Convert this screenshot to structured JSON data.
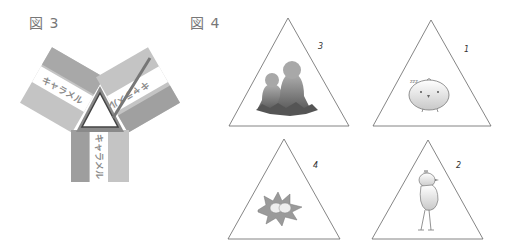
{
  "figures": {
    "fig3": {
      "label": "図 3",
      "strips": [
        {
          "position": "left",
          "text": "キャラメル"
        },
        {
          "position": "right",
          "text": "キャラメル"
        },
        {
          "position": "bottom",
          "text": "キャラメル"
        }
      ],
      "center": "white triangle"
    },
    "fig4": {
      "label": "図 4",
      "cards": [
        {
          "position": "top-left",
          "number": "3",
          "picture": "tulips-silhouette"
        },
        {
          "position": "top-right",
          "number": "1",
          "picture": "round-chick"
        },
        {
          "position": "bottom-left",
          "number": "4",
          "picture": "chick-in-nest"
        },
        {
          "position": "bottom-right",
          "number": "2",
          "picture": "standing-bird"
        }
      ]
    }
  },
  "colors": {
    "strip_dark": "#9a9a9a",
    "strip_light": "#c4c4c4",
    "outline": "#555555",
    "silhouette": "#7a7a7a"
  }
}
